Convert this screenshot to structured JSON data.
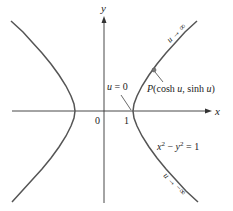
{
  "figure": {
    "axes": {
      "x_label": "x",
      "y_label": "y",
      "origin_label": "0",
      "tick_label_one": "1"
    },
    "curve": {
      "equation_lhs_x": "x",
      "equation_exp_x": "2",
      "equation_minus": " − ",
      "equation_lhs_y": "y",
      "equation_exp_y": "2",
      "equation_rhs": " = 1",
      "stroke_color": "#555555"
    },
    "annotations": {
      "point_label_prefix": "P",
      "point_label_rest": "(cosh ",
      "point_label_u1": "u",
      "point_label_mid": ", sinh ",
      "point_label_u2": "u",
      "point_label_close": ")",
      "vertex_label_u": "u",
      "vertex_label_rest": " = 0",
      "upper_limit_u": "u",
      "upper_limit_rest": " → ∞",
      "lower_limit_u": "u",
      "lower_limit_rest": " → −∞"
    }
  }
}
